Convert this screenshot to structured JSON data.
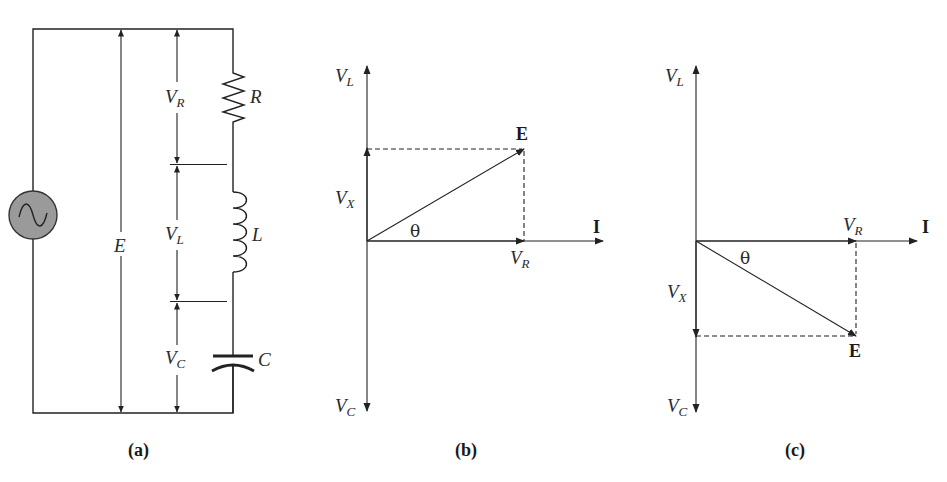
{
  "panels": {
    "a": {
      "caption": "(a)",
      "components": {
        "resistor": "R",
        "inductor": "L",
        "capacitor": "C",
        "source_voltage": "E"
      },
      "voltages": {
        "vr": {
          "main": "V",
          "sub": "R"
        },
        "vl": {
          "main": "V",
          "sub": "L"
        },
        "vc": {
          "main": "V",
          "sub": "C"
        }
      },
      "colors": {
        "source_fill": "#9a9a9a"
      }
    },
    "b": {
      "caption": "(b)",
      "axis_up": {
        "main": "V",
        "sub": "L"
      },
      "axis_down": {
        "main": "V",
        "sub": "C"
      },
      "vx": {
        "main": "V",
        "sub": "X"
      },
      "vr": {
        "main": "V",
        "sub": "R"
      },
      "current": "I",
      "resultant": "E",
      "angle": "θ"
    },
    "c": {
      "caption": "(c)",
      "axis_up": {
        "main": "V",
        "sub": "L"
      },
      "axis_down": {
        "main": "V",
        "sub": "C"
      },
      "vx": {
        "main": "V",
        "sub": "X"
      },
      "vr": {
        "main": "V",
        "sub": "R"
      },
      "current": "I",
      "resultant": "E",
      "angle": "θ"
    }
  }
}
